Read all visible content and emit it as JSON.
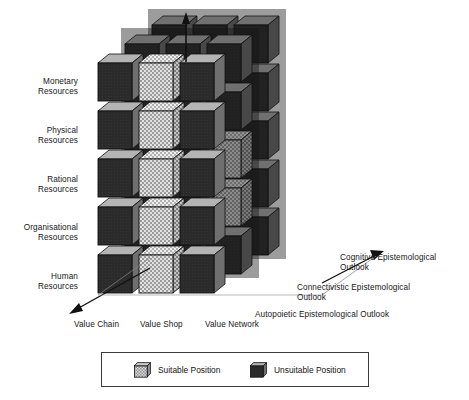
{
  "figure": {
    "type": "3d-matrix-cube-diagram",
    "title": ""
  },
  "axes": {
    "vertical": {
      "name": "Knowledge Resources",
      "arrow": "up-arrow-icon",
      "labels": [
        "Monetary\nResources",
        "Physical\nResources",
        "Rational\nResources",
        "Organisational\nResources",
        "Human\nResources"
      ],
      "labels_flat": [
        {
          "line1": "Monetary",
          "line2": "Resources"
        },
        {
          "line1": "Physical",
          "line2": "Resources"
        },
        {
          "line1": "Rational",
          "line2": "Resources"
        },
        {
          "line1": "Organisational",
          "line2": "Resources"
        },
        {
          "line1": "Human",
          "line2": "Resources"
        }
      ]
    },
    "horizontal": {
      "name": "Value Configuration",
      "arrow": "down-left-arrow-icon",
      "labels": [
        "Value Chain",
        "Value Shop",
        "Value Network"
      ]
    },
    "depth": {
      "name": "Epistemological Outlook",
      "arrow": "right-arrow-icon",
      "labels": [
        {
          "line1": "Cognitive Epistemological",
          "line2": "Outlook"
        },
        {
          "line1": "Connectivistic Epistemological",
          "line2": "Outlook"
        },
        {
          "line1": "Autopoietic Epistemological Outlook",
          "line2": ""
        }
      ]
    }
  },
  "legend": {
    "items": [
      {
        "label": "Suitable Position",
        "swatch": "suitable-cube-icon",
        "state": "suitable"
      },
      {
        "label": "Unsuitable Position",
        "swatch": "unsuitable-cube-icon",
        "state": "unsuitable"
      }
    ]
  },
  "colors": {
    "suitable_face": "#cfcfcf",
    "suitable_check_dark": "#8a8a8a",
    "unsuitable_face": "#2b2b2b",
    "cube_top": "#b4b4b4",
    "cube_side": "#6f6f6f",
    "cube_edge": "#111111",
    "axis": "#111111",
    "background": "#ffffff",
    "overlay_shadow": "rgba(20,20,20,0.42)"
  },
  "chart_data": {
    "type": "heatmap",
    "x_categories": [
      "Value Chain",
      "Value Shop",
      "Value Network"
    ],
    "y_categories": [
      "Monetary Resources",
      "Physical Resources",
      "Rational Resources",
      "Organisational Resources",
      "Human Resources"
    ],
    "z_categories": [
      "Autopoietic Epistemological Outlook",
      "Connectivistic Epistemological Outlook",
      "Cognitive Epistemological Outlook"
    ],
    "value_legend": {
      "1": "Suitable Position",
      "0": "Unsuitable Position"
    },
    "layers": [
      {
        "name": "Autopoietic Epistemological Outlook",
        "rows": [
          {
            "y": "Monetary Resources",
            "values": [
              0,
              1,
              0
            ]
          },
          {
            "y": "Physical Resources",
            "values": [
              0,
              1,
              0
            ]
          },
          {
            "y": "Rational Resources",
            "values": [
              0,
              1,
              0
            ]
          },
          {
            "y": "Organisational Resources",
            "values": [
              0,
              1,
              0
            ]
          },
          {
            "y": "Human Resources",
            "values": [
              0,
              1,
              0
            ]
          }
        ]
      },
      {
        "name": "Connectivistic Epistemological Outlook",
        "rows": [
          {
            "y": "Monetary Resources",
            "values": [
              0,
              0,
              0
            ]
          },
          {
            "y": "Physical Resources",
            "values": [
              0,
              0,
              0
            ]
          },
          {
            "y": "Rational Resources",
            "values": [
              0,
              0,
              1
            ]
          },
          {
            "y": "Organisational Resources",
            "values": [
              0,
              0,
              1
            ]
          },
          {
            "y": "Human Resources",
            "values": [
              0,
              0,
              0
            ]
          }
        ]
      },
      {
        "name": "Cognitive Epistemological Outlook",
        "rows": [
          {
            "y": "Monetary Resources",
            "values": [
              0,
              0,
              0
            ]
          },
          {
            "y": "Physical Resources",
            "values": [
              0,
              0,
              0
            ]
          },
          {
            "y": "Rational Resources",
            "values": [
              0,
              0,
              0
            ]
          },
          {
            "y": "Organisational Resources",
            "values": [
              0,
              0,
              0
            ]
          },
          {
            "y": "Human Resources",
            "values": [
              0,
              0,
              0
            ]
          }
        ]
      }
    ]
  }
}
